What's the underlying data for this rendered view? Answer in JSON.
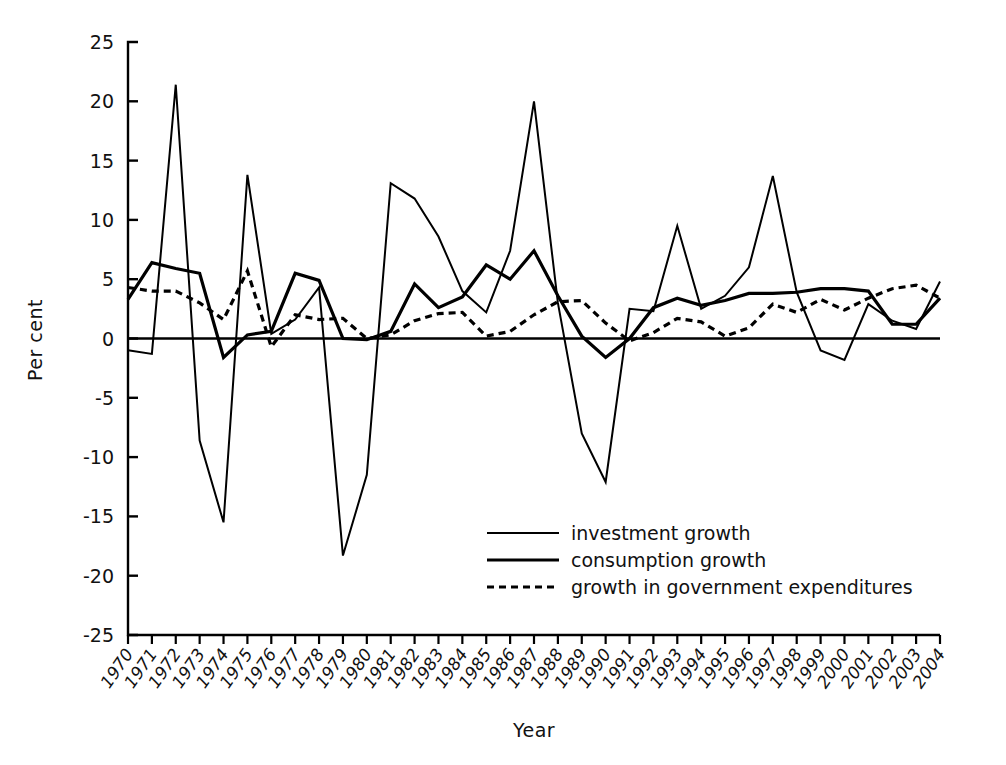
{
  "chart_data": {
    "type": "line",
    "title": "",
    "xlabel": "Year",
    "ylabel": "Per cent",
    "ylim": [
      -25,
      25
    ],
    "yticks": [
      25,
      20,
      15,
      10,
      5,
      0,
      -5,
      -10,
      -15,
      -20,
      -25
    ],
    "ytick_labels": [
      "25",
      "20",
      "15",
      "10",
      "5",
      "0",
      "-5",
      "-10",
      "-15",
      "-20",
      "-25"
    ],
    "grid": false,
    "legend_position": "inside-lower-center",
    "zero_line": true,
    "categories": [
      "1970",
      "1971",
      "1972",
      "1973",
      "1974",
      "1975",
      "1976",
      "1977",
      "1978",
      "1979",
      "1980",
      "1981",
      "1982",
      "1983",
      "1984",
      "1985",
      "1986",
      "1987",
      "1988",
      "1989",
      "1990",
      "1991",
      "1992",
      "1993",
      "1994",
      "1995",
      "1996",
      "1997",
      "1998",
      "1999",
      "2000",
      "2001",
      "2002",
      "2003",
      "2004"
    ],
    "series": [
      {
        "name": "investment growth",
        "style": "solid",
        "stroke_width": 2,
        "values": [
          -1.0,
          -1.3,
          21.4,
          -8.6,
          -15.5,
          13.8,
          0.4,
          1.6,
          4.3,
          -18.3,
          -11.5,
          13.1,
          11.8,
          8.6,
          4.0,
          2.2,
          7.4,
          20.0,
          3.0,
          -8.0,
          -12.1,
          2.5,
          2.3,
          9.5,
          2.5,
          3.6,
          6.0,
          13.7,
          3.9,
          -1.0,
          -1.8,
          2.9,
          1.5,
          0.8,
          4.8
        ]
      },
      {
        "name": "consumption growth",
        "style": "solid",
        "stroke_width": 3.2,
        "values": [
          3.3,
          6.4,
          5.9,
          5.5,
          -1.6,
          0.3,
          0.6,
          5.5,
          4.9,
          0.0,
          -0.1,
          0.6,
          4.6,
          2.6,
          3.5,
          6.2,
          5.0,
          7.4,
          3.6,
          0.2,
          -1.6,
          0.0,
          2.6,
          3.4,
          2.8,
          3.2,
          3.8,
          3.8,
          3.9,
          4.2,
          4.2,
          4.0,
          1.2,
          1.2,
          3.4
        ]
      },
      {
        "name": "growth in government expenditures",
        "style": "dashed",
        "stroke_width": 3.2,
        "values": [
          4.3,
          4.0,
          4.0,
          3.0,
          1.6,
          5.7,
          -0.7,
          2.0,
          1.6,
          1.7,
          0.0,
          0.3,
          1.5,
          2.1,
          2.2,
          0.2,
          0.6,
          2.0,
          3.1,
          3.2,
          1.3,
          -0.2,
          0.5,
          1.7,
          1.4,
          0.2,
          0.9,
          2.9,
          2.2,
          3.3,
          2.4,
          3.4,
          4.2,
          4.5,
          3.4
        ]
      }
    ],
    "legend": [
      {
        "label": "investment growth",
        "style": "solid",
        "stroke_width": 2
      },
      {
        "label": "consumption growth",
        "style": "solid",
        "stroke_width": 3.2
      },
      {
        "label": "growth in government expenditures",
        "style": "dashed",
        "stroke_width": 3.2
      }
    ]
  }
}
